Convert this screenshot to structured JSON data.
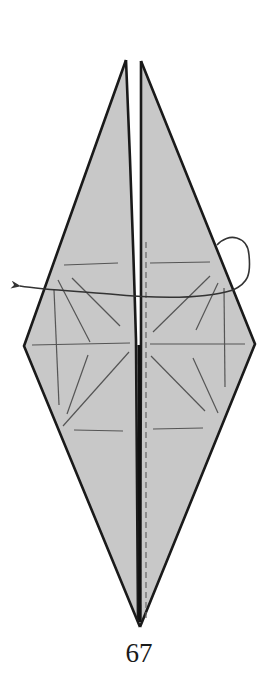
{
  "diagram": {
    "type": "origami-folding-step",
    "step_number": "67",
    "instruction_symbols": [
      "mountain-fold-arrow",
      "valley-fold-dashed-line",
      "crease-lines"
    ],
    "colors": {
      "paper_fill": "#c8c8c8",
      "outline": "#1a1a1a",
      "crease": "#555555",
      "arrow": "#333333",
      "background": "#ffffff"
    },
    "geometry": {
      "left_flap_tip": [
        126,
        60
      ],
      "right_flap_tip": [
        141,
        61
      ],
      "left_corner": [
        24,
        346
      ],
      "right_corner": [
        255,
        344
      ],
      "bottom_tip": [
        140,
        627
      ]
    }
  }
}
